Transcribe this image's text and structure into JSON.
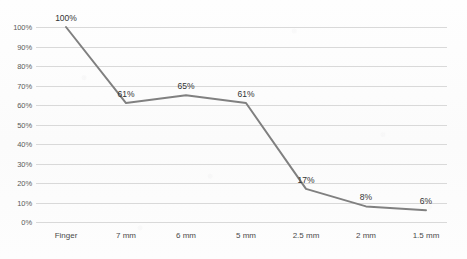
{
  "chart_data": {
    "type": "line",
    "title": "",
    "xlabel": "",
    "ylabel": "",
    "categories": [
      "Finger",
      "7 mm",
      "6 mm",
      "5 mm",
      "2.5 mm",
      "2 mm",
      "1.5 mm"
    ],
    "values": [
      100,
      61,
      65,
      61,
      17,
      8,
      6
    ],
    "point_labels": [
      "100%",
      "61%",
      "65%",
      "61%",
      "17%",
      "8%",
      "6%"
    ],
    "ylim": [
      0,
      100
    ],
    "ytick_labels": [
      "100%",
      "90%",
      "80%",
      "70%",
      "60%",
      "50%",
      "40%",
      "30%",
      "20%",
      "10%",
      "0%"
    ],
    "ytick_values": [
      100,
      90,
      80,
      70,
      60,
      50,
      40,
      30,
      20,
      10,
      0
    ],
    "grid": true,
    "legend": "none",
    "series_color": "#808080",
    "grid_color": "#d9d9d9",
    "text_color": "#4a4a4a"
  }
}
